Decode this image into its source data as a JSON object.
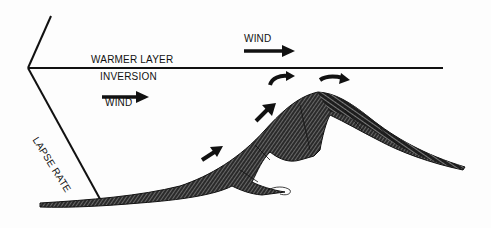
{
  "diagram": {
    "labels": {
      "warmer_layer": "WARMER LAYER",
      "inversion": "INVERSION",
      "wind_low": "WIND",
      "wind_high": "WIND",
      "lapse_rate": "LAPSE RATE"
    },
    "colors": {
      "ink": "#111111",
      "background": "#fdfdfd"
    },
    "elements": {
      "inversion_line": {
        "from": [
          28,
          68
        ],
        "to": [
          443,
          68
        ]
      },
      "upper_temperature_line": {
        "from": [
          28,
          68
        ],
        "to": [
          51,
          16
        ]
      },
      "lapse_rate_line": {
        "from": [
          28,
          68
        ],
        "to": [
          100,
          199
        ]
      },
      "mountain_peak": [
        318,
        92
      ],
      "wind_arrows_count": 6
    }
  }
}
